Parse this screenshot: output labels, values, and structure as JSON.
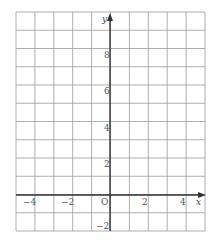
{
  "diagram": {
    "type": "coordinate-grid",
    "x_axis_label": "x",
    "y_axis_label": "y",
    "origin_label": "O",
    "x_range": [
      -5,
      5
    ],
    "y_range": [
      -2,
      10
    ],
    "x_ticks": [
      {
        "value": -4,
        "label": "−4"
      },
      {
        "value": -2,
        "label": "−2"
      },
      {
        "value": 2,
        "label": "2"
      },
      {
        "value": 4,
        "label": "4"
      }
    ],
    "y_ticks": [
      {
        "value": 8,
        "label": "8"
      },
      {
        "value": 6,
        "label": "6"
      },
      {
        "value": 4,
        "label": "4"
      },
      {
        "value": 2,
        "label": "2"
      },
      {
        "value": -2,
        "label": "−2"
      }
    ],
    "colors": {
      "grid": "#9a9a9a",
      "axis": "#333333",
      "text": "#555555"
    }
  }
}
